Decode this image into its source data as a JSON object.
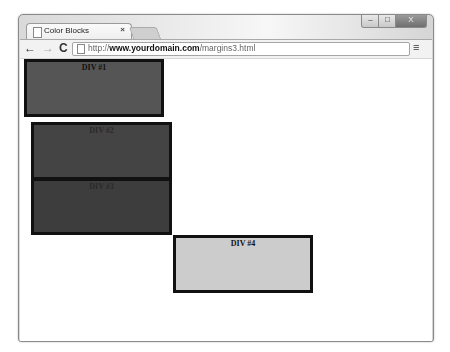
{
  "window": {
    "controls": {
      "minimize": "–",
      "maximize": "□",
      "close": "X"
    }
  },
  "tab": {
    "title": "Color Blocks",
    "close_glyph": "×"
  },
  "toolbar": {
    "back_glyph": "←",
    "forward_glyph": "→",
    "reload_glyph": "C",
    "url_prefix": "http://",
    "url_domain": "www.yourdomain.com",
    "url_path": "/margins3.html",
    "menu_glyph": "≡"
  },
  "blocks": [
    {
      "label": "DIV #1",
      "color": "#555555"
    },
    {
      "label": "DIV #2",
      "color": "#444444"
    },
    {
      "label": "DIV #3",
      "color": "#3d3d3d"
    },
    {
      "label": "DIV #4",
      "color": "#cccccc"
    }
  ]
}
